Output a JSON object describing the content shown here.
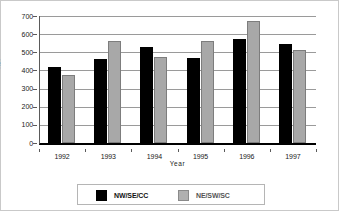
{
  "chart_data": {
    "type": "bar",
    "title": "",
    "subtitle": "",
    "xlabel": "Year",
    "ylabel": "RDI",
    "categories": [
      "1992",
      "1993",
      "1994",
      "1995",
      "1996",
      "1997"
    ],
    "series": [
      {
        "name": "NW/SE/CC",
        "color": "#000000",
        "values": [
          420,
          465,
          528,
          468,
          573,
          545
        ]
      },
      {
        "name": "NE/SW/SC",
        "color": "#a8a8a8",
        "values": [
          375,
          560,
          472,
          563,
          675,
          515
        ]
      }
    ],
    "ylim": [
      0,
      700
    ],
    "yticks": [
      0,
      100,
      200,
      300,
      400,
      500,
      600,
      700
    ],
    "ytick_labels": [
      "0",
      "100",
      "200",
      "300",
      "400",
      "500",
      "600",
      "700"
    ],
    "grid": "horizontal",
    "legend_position": "bottom"
  },
  "axes": {
    "y_label": "RDI",
    "x_label": "Year"
  },
  "legend": {
    "entries": [
      {
        "label": "NW/SE/CC",
        "color": "#000000"
      },
      {
        "label": "NE/SW/SC",
        "color": "#a8a8a8"
      }
    ]
  }
}
